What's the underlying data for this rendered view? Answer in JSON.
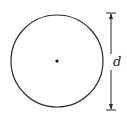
{
  "diagram": {
    "type": "circle-with-diameter",
    "circle": {
      "cx": 57,
      "cy": 61,
      "r": 46,
      "stroke": "#2a2a2a"
    },
    "center_point": {
      "x": 57,
      "y": 61
    },
    "dimension": {
      "label": "d",
      "meaning": "diameter",
      "x": 111,
      "y_top": 13,
      "y_bottom": 110
    }
  }
}
